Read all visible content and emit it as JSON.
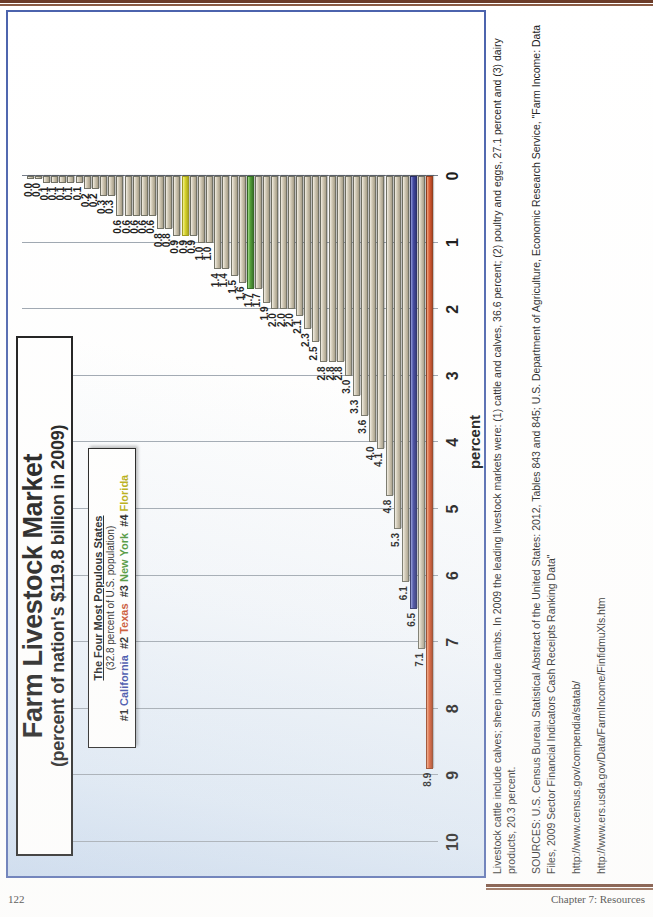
{
  "page": {
    "number": "122",
    "chapter_label": "Chapter 7: Resources"
  },
  "slide": {
    "title": "Farm Livestock Market",
    "subtitle": "(percent of nation's $119.8 billion in 2009)",
    "legend": {
      "heading": "The Four Most Populous States",
      "subheading": "(32.8 percent of U.S. population)",
      "entries": [
        {
          "rank": "#1",
          "state": "California",
          "color": "#2e3fa3"
        },
        {
          "rank": "#2",
          "state": "Texas",
          "color": "#c5441b"
        },
        {
          "rank": "#3",
          "state": "New York",
          "color": "#3f8f2c"
        },
        {
          "rank": "#4",
          "state": "Florida",
          "color": "#b2a800"
        }
      ]
    }
  },
  "chart_data": {
    "type": "bar",
    "orientation": "horizontal",
    "title": "Farm Livestock Market",
    "subtitle": "(percent of nation's $119.8 billion in 2009)",
    "xlabel": "",
    "ylabel": "percent",
    "ylim": [
      0,
      10
    ],
    "tick_labels": [
      "10",
      "9",
      "8",
      "7",
      "6",
      "5",
      "4",
      "3",
      "2",
      "1",
      "0"
    ],
    "grid": true,
    "legend_position": "top-center",
    "highlight_colors": {
      "default": "#bdb49c",
      "texas": "#d9542a",
      "california": "#39409e",
      "new_york": "#4a9a2e",
      "florida": "#d6d220"
    },
    "categories": [
      "Texas",
      "Iowa",
      "California",
      "Nebraska",
      "Kansas",
      "North Carolina",
      "Minnesota",
      "Wisconsin",
      "Georgia",
      "Arkansas",
      "Oklahoma",
      "Alabama",
      "Colorado",
      "Missouri",
      "Pennsylvania",
      "Mississippi",
      "Idaho",
      "Kentucky",
      "Indiana",
      "South Dakota",
      "Ohio",
      "New Mexico",
      "New York",
      "Michigan",
      "Illinois",
      "Washington",
      "Virginia",
      "South Carolina",
      "Arizona",
      "Tennessee",
      "Florida",
      "Montana",
      "Maryland",
      "Oregon",
      "Louisiana",
      "North Dakota",
      "Delaware",
      "Utah",
      "Wyoming",
      "West Virginia",
      "Vermont",
      "Nevada",
      "Maine",
      "Connecticut",
      "New Jersey",
      "Massachusetts",
      "New Hampshire",
      "Hawaii",
      "Rhode Island",
      "Alaska"
    ],
    "values": [
      8.9,
      7.1,
      6.5,
      6.1,
      5.3,
      4.8,
      4.1,
      4.0,
      3.6,
      3.3,
      3.0,
      2.8,
      2.8,
      2.8,
      2.5,
      2.3,
      2.1,
      2.0,
      2.0,
      2.0,
      1.9,
      1.7,
      1.7,
      1.6,
      1.5,
      1.4,
      1.4,
      1.0,
      1.0,
      0.9,
      0.9,
      0.9,
      0.8,
      0.8,
      0.6,
      0.6,
      0.6,
      0.6,
      0.6,
      0.3,
      0.3,
      0.2,
      0.2,
      0.1,
      0.1,
      0.1,
      0.1,
      0.1,
      0.0,
      0.0
    ],
    "value_labels": [
      "8.9",
      "7.1",
      "6.5",
      "6.1",
      "5.3",
      "4.8",
      "4.1",
      "4.0",
      "3.6",
      "3.3",
      "3.0",
      "2.8",
      "2.8",
      "2.8",
      "2.5",
      "2.3",
      "2.1",
      "2.0",
      "2.0",
      "2.0",
      "1.9",
      "1.7",
      "1.7",
      "1.6",
      "1.5",
      "1.4",
      "1.4",
      "1.0",
      "1.0",
      "0.9",
      "0.9",
      "0.9",
      "0.8",
      "0.8",
      "0.6",
      "0.6",
      "0.6",
      "0.6",
      "0.6",
      "0.3",
      "0.3",
      "0.2",
      "0.2",
      "0.1",
      "0.1",
      "0.1",
      "0.1",
      "0.1",
      "0.0",
      "0.0"
    ],
    "series_colors": [
      "tx",
      "",
      "ca",
      "",
      "",
      "",
      "",
      "",
      "",
      "",
      "",
      "",
      "",
      "",
      "",
      "",
      "",
      "",
      "",
      "",
      "",
      "",
      "ny",
      "",
      "",
      "",
      "",
      "",
      "",
      "",
      "fl",
      "",
      "",
      "",
      "",
      "",
      "",
      "",
      "",
      "",
      "",
      "",
      "",
      "",
      "",
      "",
      "",
      "",
      "",
      ""
    ]
  },
  "notes": {
    "footnote": "Livestock cattle include calves; sheep include lambs. In 2009 the leading livestock markets were: (1) cattle and calves, 36.6 percent; (2) poultry and eggs, 27.1 percent and (3) dairy products, 20.3 percent.",
    "sources": "SOURCES: U.S. Census Bureau Statistical Abstract of the United States: 2012, Tables 843 and 845; U.S. Department of Agriculture, Economic Research Service, \"Farm Income: Data Files, 2009 Sector Financial Indicators Cash Receipts Ranking Data\"",
    "url1": "http://www.census.gov/compendia/statab/",
    "url2": "http://www.ers.usda.gov/Data/FarmIncome/FinfidmuXls.htm"
  }
}
